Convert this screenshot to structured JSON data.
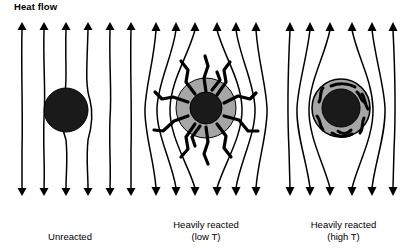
{
  "figure": {
    "heat_flow_label": "Heat flow",
    "background_color": "#ffffff",
    "line_color": "#000000",
    "core_color": "#1a1a1a",
    "rim_color": "#a6a6a6",
    "panel_count": 3,
    "field_lines_per_panel": 6,
    "arrow_direction": "down"
  },
  "panels": [
    {
      "id": "unreacted",
      "caption_line1": "Unreacted",
      "caption_line2": "",
      "particle": {
        "core_label": "unreacted-core",
        "core_color": "#1a1a1a",
        "core_diameter_px": 44,
        "rim_present": false,
        "rim_color": "",
        "rim_diameter_px": 0,
        "texture": "none"
      },
      "flow_pattern": "straight",
      "deflection": "none"
    },
    {
      "id": "heavily-reacted-low-t",
      "caption_line1": "Heavily reacted",
      "caption_line2": "(low T)",
      "particle": {
        "core_label": "reacted-core",
        "core_color": "#1a1a1a",
        "core_diameter_px": 32,
        "rim_present": true,
        "rim_color": "#a6a6a6",
        "rim_diameter_px": 60,
        "texture": "radial-dendritic-cracks"
      },
      "flow_pattern": "deflected",
      "deflection": "strong"
    },
    {
      "id": "heavily-reacted-high-t",
      "caption_line1": "Heavily reacted",
      "caption_line2": "(high T)",
      "particle": {
        "core_label": "reacted-core",
        "core_color": "#1a1a1a",
        "core_diameter_px": 38,
        "rim_present": true,
        "rim_color": "#a6a6a6",
        "rim_diameter_px": 58,
        "texture": "discontinuous-flecks"
      },
      "flow_pattern": "deflected",
      "deflection": "moderate"
    }
  ]
}
